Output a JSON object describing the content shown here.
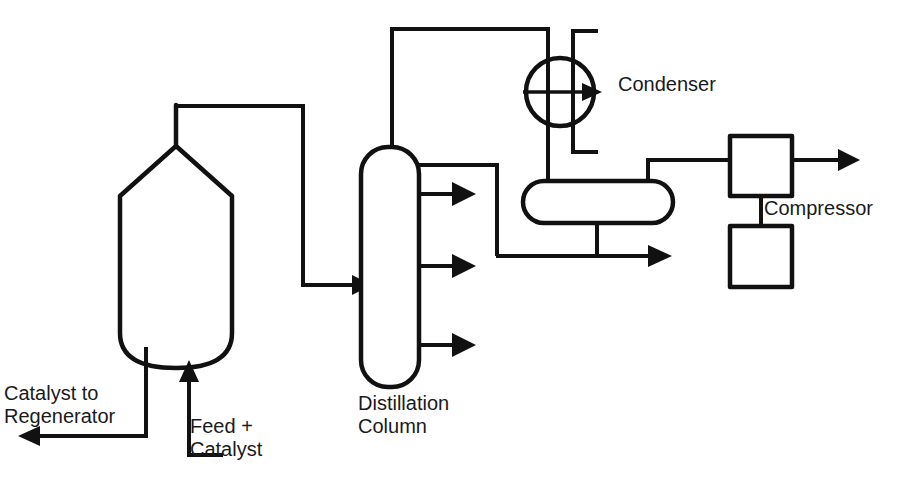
{
  "diagram": {
    "background_color": "#ffffff",
    "line_color": "#111111",
    "labels": {
      "condenser": "Condenser",
      "compressor": "Compressor",
      "distillation_column": "Distillation\nColumn",
      "catalyst_to_regenerator": "Catalyst to\nRegenerator",
      "feed_plus_catalyst": "Feed +\nCatalyst"
    },
    "equipment": [
      {
        "name": "reactor-vessel",
        "label": "",
        "shape": "vertical-vessel-with-cone-top"
      },
      {
        "name": "distillation-column",
        "label": "Distillation Column",
        "shape": "vertical-column-rounded-ends"
      },
      {
        "name": "condenser",
        "label": "Condenser",
        "shape": "circle-with-arrow"
      },
      {
        "name": "reflux-drum",
        "label": "",
        "shape": "horizontal-capsule"
      },
      {
        "name": "compressor-upper-stage",
        "label": "Compressor",
        "shape": "square-box"
      },
      {
        "name": "compressor-lower-stage",
        "label": "Compressor",
        "shape": "square-box"
      }
    ],
    "streams": [
      {
        "name": "feed-plus-catalyst-inlet",
        "label": "Feed + Catalyst",
        "direction": "up-into-reactor"
      },
      {
        "name": "catalyst-to-regenerator-outlet",
        "label": "Catalyst to Regenerator",
        "direction": "left-out"
      },
      {
        "name": "reactor-overhead-to-column",
        "label": "",
        "direction": "right-into-column"
      },
      {
        "name": "column-overhead-vapor",
        "label": "",
        "direction": "up-then-right-to-condenser"
      },
      {
        "name": "column-side-draw-1",
        "label": "",
        "direction": "right-out"
      },
      {
        "name": "column-side-draw-2",
        "label": "",
        "direction": "right-out"
      },
      {
        "name": "column-side-draw-3",
        "label": "",
        "direction": "right-out"
      },
      {
        "name": "reflux-return-to-column",
        "label": "",
        "direction": "from-column-right-down"
      },
      {
        "name": "condensate-to-drum",
        "label": "",
        "direction": "down-into-drum"
      },
      {
        "name": "cooling-water-supply",
        "label": "",
        "direction": "into-condenser"
      },
      {
        "name": "cooling-water-return",
        "label": "",
        "direction": "out-of-condenser"
      },
      {
        "name": "drum-liquid-bottoms",
        "label": "",
        "direction": "right-out-with-arrow"
      },
      {
        "name": "drum-gas-to-compressor",
        "label": "",
        "direction": "right-into-compressor"
      },
      {
        "name": "compressor-discharge",
        "label": "",
        "direction": "right-out-with-arrow"
      },
      {
        "name": "compressor-interstage",
        "label": "",
        "direction": "down-between-stages"
      }
    ]
  }
}
